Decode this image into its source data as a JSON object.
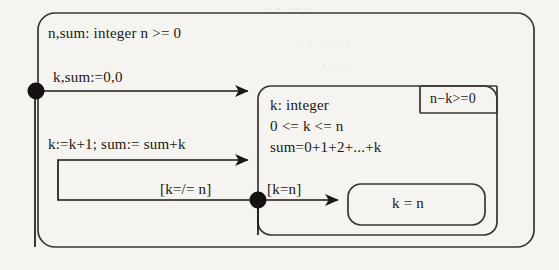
{
  "diagram": {
    "type": "uml-state-machine",
    "title_visible": false,
    "background_color": "#f6f4f1",
    "ink_color": "#1a1714",
    "outer_state": {
      "declaration": "n,sum: integer   n >= 0"
    },
    "inner_state": {
      "invariant_lines": [
        "k: integer",
        "0 <= k <= n",
        "sum=0+1+2+...+k"
      ],
      "corner_annotation": "n−k>=0"
    },
    "final_state": {
      "label": "k = n"
    },
    "transitions": [
      {
        "name": "initial",
        "label": "k,sum:=0,0"
      },
      {
        "name": "loop-back",
        "label": "k:=k+1; sum:= sum+k"
      },
      {
        "name": "guard-not-equal",
        "label": "[k=/= n]"
      },
      {
        "name": "guard-equal",
        "label": "[k=n]"
      }
    ],
    "nodes": [
      {
        "name": "start-dot",
        "shape": "filled-circle"
      },
      {
        "name": "junction-dot",
        "shape": "filled-circle"
      }
    ],
    "bleed_through": [
      "· · · · ·",
      "· · · · · ·",
      "· · · ·"
    ]
  }
}
